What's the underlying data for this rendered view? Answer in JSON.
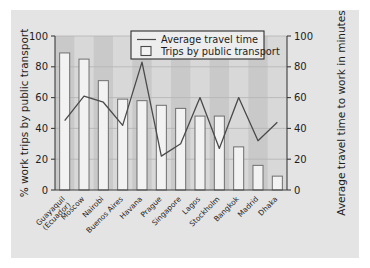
{
  "figure": {
    "panel_color": "#e4e4e4",
    "background": "#ffffff",
    "plot_background": "#d8d8d8",
    "plot_band_color": "#c9c9c9",
    "bar_fill": "#f2f2f2",
    "bar_stroke": "#6f6f6f",
    "line_color": "#4a4a4a",
    "axis_color": "#3c3c3c"
  },
  "axes": {
    "left_title": "% work trips by public transport",
    "right_title": "Average travel time to work in minutes",
    "left_ticks": [
      "0",
      "20",
      "40",
      "60",
      "80",
      "100"
    ],
    "right_ticks": [
      "0",
      "20",
      "40",
      "60",
      "80",
      "100"
    ]
  },
  "legend": {
    "line_label": "Average travel time",
    "bar_label": "Trips by public transport"
  },
  "chart_data": {
    "type": "bar",
    "title": "",
    "xlabel": "",
    "ylabel": "% work trips by public transport",
    "y2label": "Average travel time to work in minutes",
    "ylim": [
      0,
      100
    ],
    "y2lim": [
      0,
      100
    ],
    "yticks": [
      0,
      20,
      40,
      60,
      80,
      100
    ],
    "y2ticks": [
      0,
      20,
      40,
      60,
      80,
      100
    ],
    "grid": true,
    "legend_position": "top-center",
    "categories": [
      "Guayaquil (Ecuador)",
      "Moscow",
      "Nairobi",
      "Buenos Aires",
      "Havana",
      "Prague",
      "Singapore",
      "Lagos",
      "Stockholm",
      "Bangkok",
      "Madrid",
      "Dhaka"
    ],
    "category_lines": [
      [
        "Guayaquil",
        "(Ecuador)"
      ],
      [
        "Moscow"
      ],
      [
        "Nairobi"
      ],
      [
        "Buenos Aires"
      ],
      [
        "Havana"
      ],
      [
        "Prague"
      ],
      [
        "Singapore"
      ],
      [
        "Lagos"
      ],
      [
        "Stockholm"
      ],
      [
        "Bangkok"
      ],
      [
        "Madrid"
      ],
      [
        "Dhaka"
      ]
    ],
    "series": [
      {
        "name": "Trips by public transport",
        "type": "bar",
        "axis": "left",
        "unit": "%",
        "values": [
          89,
          85,
          71,
          59,
          58,
          55,
          53,
          48,
          48,
          28,
          16,
          9
        ]
      },
      {
        "name": "Average travel time",
        "type": "line",
        "axis": "right",
        "unit": "minutes",
        "values": [
          45,
          61,
          57,
          42,
          83,
          22,
          30,
          60,
          27,
          60,
          32,
          44
        ]
      }
    ]
  }
}
